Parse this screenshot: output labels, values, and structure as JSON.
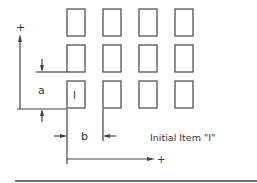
{
  "diagram": {
    "type": "grid-layout-dimension-drawing",
    "colors": {
      "stroke": "#444444",
      "background": "#ffffff"
    },
    "grid": {
      "rows": 3,
      "columns": 4,
      "initial_item_label": "I"
    },
    "dimensions": {
      "vertical_label": "a",
      "horizontal_label": "b"
    },
    "axes": {
      "vertical_plus": "+",
      "horizontal_plus": "+"
    },
    "caption": "Initial Item \"I\""
  }
}
